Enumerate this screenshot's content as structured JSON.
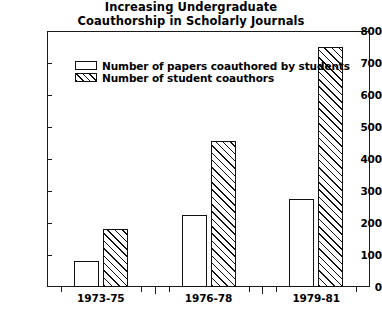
{
  "chart_data": {
    "type": "bar",
    "title": "Increasing Undergraduate Coauthorship in Scholarly Journals",
    "title_lines": [
      "Increasing Undergraduate",
      "Coauthorship in Scholarly Journals"
    ],
    "xlabel": "",
    "ylabel": "",
    "categories": [
      "1973-75",
      "1976-78",
      "1979-81"
    ],
    "ylim": [
      0,
      800
    ],
    "yticks": [
      0,
      100,
      200,
      300,
      400,
      500,
      600,
      700,
      800
    ],
    "ytick_labels": [
      "0",
      "100",
      "200",
      "300",
      "400",
      "500",
      "600",
      "700",
      "800"
    ],
    "grid": false,
    "legend_position": "upper left inside",
    "series": [
      {
        "name": "Number of papers coauthored by students",
        "fill": "white",
        "values": [
          80,
          225,
          275
        ]
      },
      {
        "name": "Number of student coauthors",
        "fill": "diagonal-hatch",
        "values": [
          180,
          455,
          750
        ]
      }
    ]
  },
  "colors": {
    "ink": "#111111",
    "background": "#ffffff"
  }
}
